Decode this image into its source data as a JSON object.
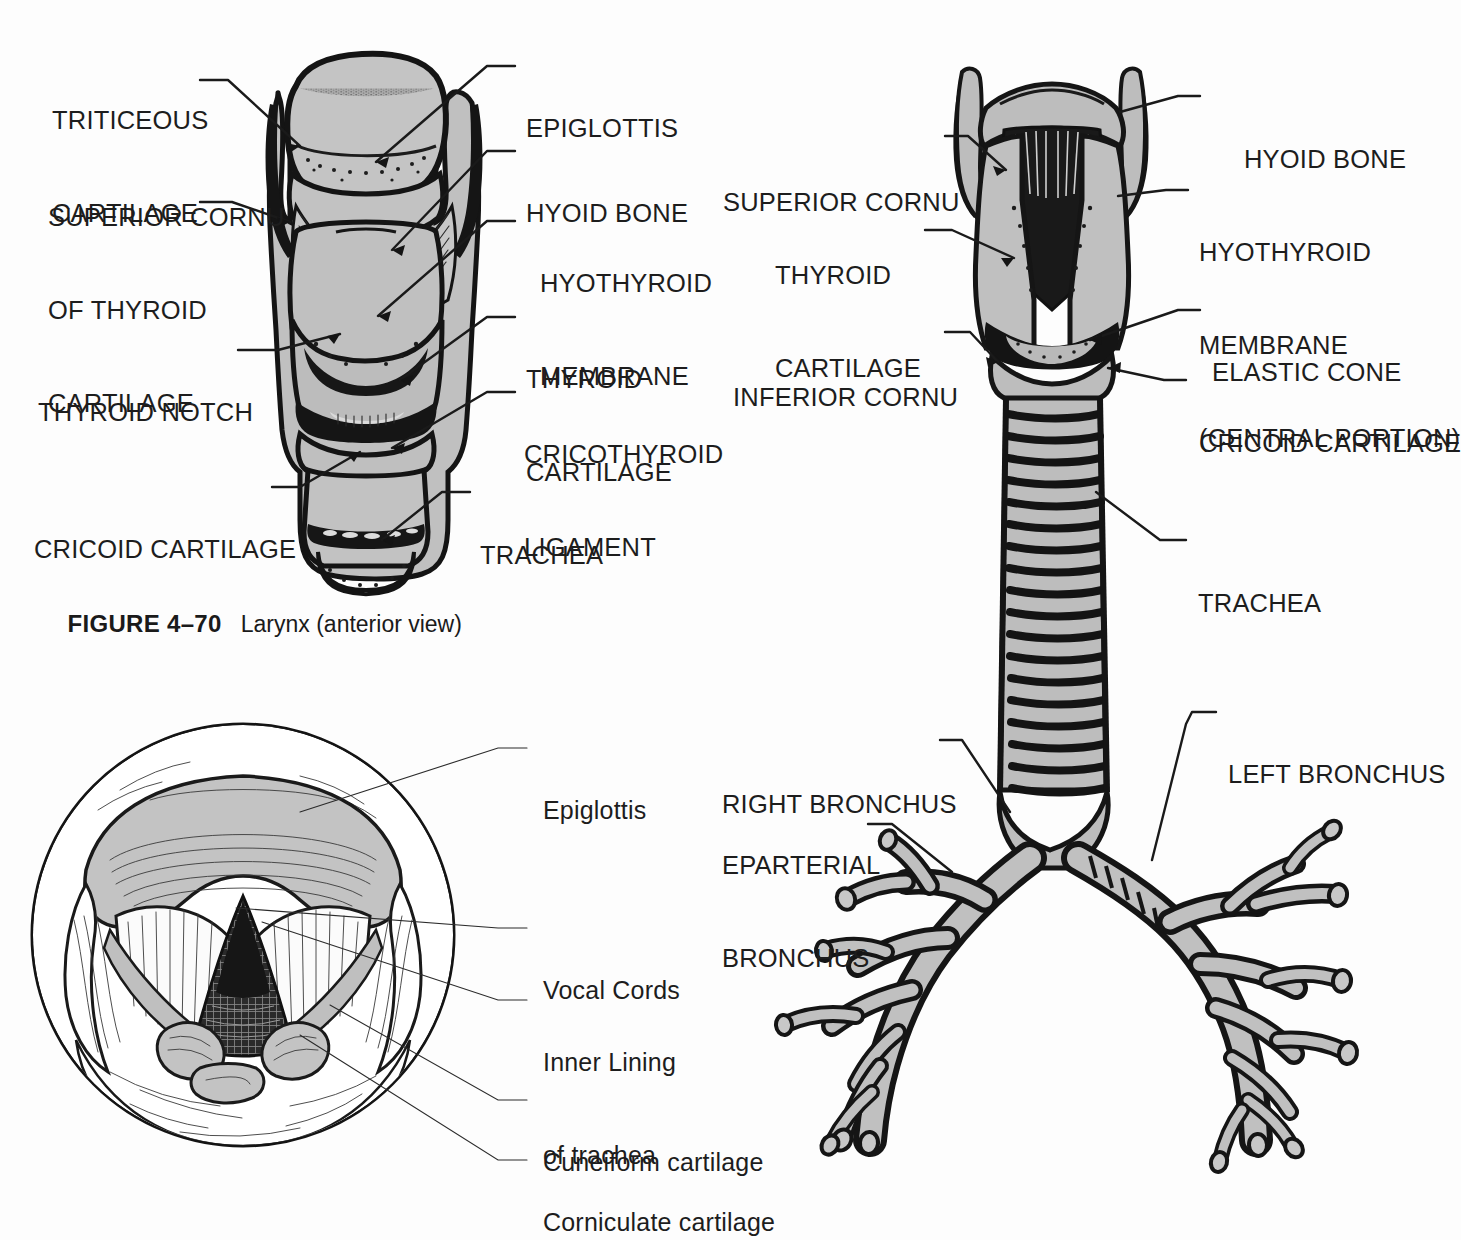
{
  "figure_caption": {
    "number": "FIGURE 4–70",
    "text": "Larynx (anterior view)"
  },
  "figures": [
    {
      "id": "larynx-anterior",
      "labels_left": [
        {
          "name": "triticeous-cartilage",
          "lines": [
            "TRITICEOUS",
            "CARTILAGE"
          ]
        },
        {
          "name": "superior-cornu-of-thyroid-cartilage",
          "lines": [
            "SUPERIOR CORNU",
            "OF THYROID",
            "CARTILAGE"
          ]
        },
        {
          "name": "thyroid-notch",
          "lines": [
            "THYROID NOTCH"
          ]
        },
        {
          "name": "cricoid-cartilage",
          "lines": [
            "CRICOID CARTILAGE"
          ]
        }
      ],
      "labels_right": [
        {
          "name": "epiglottis",
          "lines": [
            "EPIGLOTTIS"
          ]
        },
        {
          "name": "hyoid-bone",
          "lines": [
            "HYOID BONE"
          ]
        },
        {
          "name": "hyothyroid-membrane",
          "lines": [
            "HYOTHYROID",
            "MEMBRANE"
          ]
        },
        {
          "name": "thyroid-cartilage",
          "lines": [
            "THYROID",
            "CARTILAGE"
          ]
        },
        {
          "name": "cricothyroid-ligament",
          "lines": [
            "CRICOTHYROID",
            "LIGAMENT"
          ]
        },
        {
          "name": "trachea",
          "lines": [
            "TRACHEA"
          ]
        }
      ]
    },
    {
      "id": "larynx-posterior-trachea-bronchi",
      "labels_left": [
        {
          "name": "superior-cornu",
          "lines": [
            "SUPERIOR CORNU"
          ]
        },
        {
          "name": "thyroid-cartilage",
          "lines": [
            "THYROID",
            "CARTILAGE"
          ]
        },
        {
          "name": "inferior-cornu",
          "lines": [
            "INFERIOR CORNU"
          ]
        },
        {
          "name": "right-bronchus",
          "lines": [
            "RIGHT BRONCHUS"
          ]
        },
        {
          "name": "eparterial-bronchus",
          "lines": [
            "EPARTERIAL",
            "BRONCHUS"
          ]
        }
      ],
      "labels_right": [
        {
          "name": "hyoid-bone",
          "lines": [
            "HYOID BONE"
          ]
        },
        {
          "name": "hyothyroid-membrane-central-portion",
          "lines": [
            "HYOTHYROID",
            "MEMBRANE",
            "(CENTRAL PORTION)"
          ]
        },
        {
          "name": "elastic-cone",
          "lines": [
            "ELASTIC CONE"
          ]
        },
        {
          "name": "cricoid-cartilage",
          "lines": [
            "CRICOID CARTILAGE"
          ]
        },
        {
          "name": "trachea",
          "lines": [
            "TRACHEA"
          ]
        },
        {
          "name": "left-bronchus",
          "lines": [
            "LEFT BRONCHUS"
          ]
        }
      ]
    },
    {
      "id": "laryngoscopic-view",
      "labels_right": [
        {
          "name": "epiglottis",
          "lines": [
            "Epiglottis"
          ]
        },
        {
          "name": "vocal-cords",
          "lines": [
            "Vocal Cords"
          ]
        },
        {
          "name": "inner-lining-of-trachea",
          "lines": [
            "Inner Lining",
            "of trachea"
          ]
        },
        {
          "name": "cuneiform-cartilage",
          "lines": [
            "Cuneiform cartilage"
          ]
        },
        {
          "name": "corniculate-cartilage",
          "lines": [
            "Corniculate cartilage"
          ]
        }
      ]
    }
  ],
  "colors": {
    "page_background": "#fdfdfd",
    "ink": "#1a1a1a",
    "cartilage_gray": "#bdbdbd",
    "shadow_gray": "#d8d8d8"
  }
}
